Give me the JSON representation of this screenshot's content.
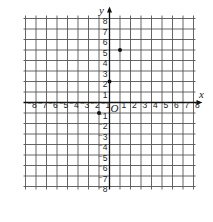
{
  "diagram": {
    "type": "coordinate-plane",
    "x_axis_label": "x",
    "y_axis_label": "y",
    "origin_label": "O",
    "x_range": [
      -8,
      8
    ],
    "y_range": [
      -8,
      8
    ],
    "x_tick_labels": [
      "⁻8",
      "⁻7",
      "⁻6",
      "⁻5",
      "⁻4",
      "⁻3",
      "⁻2",
      "⁻1",
      "1",
      "2",
      "3",
      "4",
      "5",
      "6",
      "7",
      "8"
    ],
    "y_tick_labels": [
      "8",
      "7",
      "6",
      "5",
      "4",
      "3",
      "2",
      "1",
      "⁻1",
      "⁻2",
      "⁻3",
      "⁻4",
      "⁻5",
      "⁻6",
      "⁻7",
      "⁻8"
    ],
    "points": [
      {
        "x": 1,
        "y": 5
      },
      {
        "x": 0,
        "y": 2
      },
      {
        "x": -1,
        "y": -1
      }
    ],
    "colors": {
      "grid": "#555555",
      "axis": "#111111",
      "point": "#111111"
    }
  }
}
